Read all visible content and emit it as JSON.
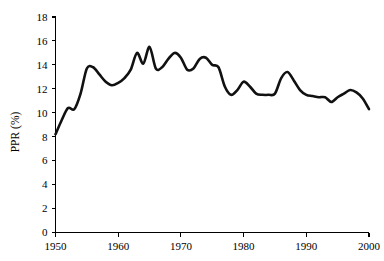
{
  "chart_data": {
    "type": "line",
    "title": "",
    "xlabel": "",
    "ylabel": "PPR (%)",
    "xlim": [
      1950,
      2000
    ],
    "ylim": [
      0,
      18
    ],
    "grid": false,
    "legend": null,
    "x_ticks": [
      "1950",
      "1960",
      "1970",
      "1980",
      "1990",
      "2000"
    ],
    "x_tick_values": [
      1950,
      1960,
      1970,
      1980,
      1990,
      2000
    ],
    "y_ticks": [
      "0",
      "2",
      "4",
      "6",
      "8",
      "10",
      "12",
      "14",
      "16",
      "18"
    ],
    "y_tick_values": [
      0,
      2,
      4,
      6,
      8,
      10,
      12,
      14,
      16,
      18
    ],
    "series": [
      {
        "name": "PPR",
        "color": "#111111",
        "x": [
          1950,
          1951,
          1952,
          1953,
          1954,
          1955,
          1956,
          1957,
          1958,
          1959,
          1960,
          1961,
          1962,
          1963,
          1964,
          1965,
          1966,
          1967,
          1968,
          1969,
          1970,
          1971,
          1972,
          1973,
          1974,
          1975,
          1976,
          1977,
          1978,
          1979,
          1980,
          1981,
          1982,
          1983,
          1984,
          1985,
          1986,
          1987,
          1988,
          1989,
          1990,
          1991,
          1992,
          1993,
          1994,
          1995,
          1996,
          1997,
          1998,
          1999,
          2000
        ],
        "values": [
          8.2,
          9.4,
          10.4,
          10.3,
          11.6,
          13.7,
          13.8,
          13.2,
          12.6,
          12.3,
          12.5,
          12.9,
          13.6,
          15.0,
          14.1,
          15.5,
          13.7,
          13.8,
          14.5,
          15.0,
          14.6,
          13.6,
          13.7,
          14.5,
          14.6,
          14.0,
          13.8,
          12.2,
          11.5,
          11.9,
          12.6,
          12.2,
          11.6,
          11.5,
          11.5,
          11.6,
          12.9,
          13.4,
          12.7,
          11.9,
          11.5,
          11.4,
          11.3,
          11.3,
          10.9,
          11.3,
          11.6,
          11.9,
          11.7,
          11.2,
          10.3
        ]
      }
    ]
  }
}
